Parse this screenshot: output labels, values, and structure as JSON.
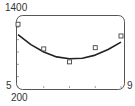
{
  "chart_data": {
    "type": "scatter",
    "title": "",
    "xlabel": "",
    "ylabel": "",
    "xlim": [
      5,
      9
    ],
    "ylim": [
      200,
      1400
    ],
    "x_tick_labels": {
      "min": "5",
      "max": "9"
    },
    "y_tick_labels": {
      "max": "1400",
      "min": "200"
    },
    "x_ticks": [
      5,
      6,
      7,
      8,
      9
    ],
    "y_ticks": [
      400,
      600,
      800,
      1000,
      1200
    ],
    "grid": false,
    "series": [
      {
        "name": "data",
        "type": "scatter",
        "marker": "square",
        "x": [
          5,
          6,
          7,
          8,
          9
        ],
        "y": [
          1250,
          850,
          640,
          870,
          1060
        ]
      },
      {
        "name": "quadratic fit",
        "type": "line",
        "x": [
          5,
          5.5,
          6,
          6.5,
          7,
          7.5,
          8,
          8.5,
          9
        ],
        "y": [
          1080,
          920,
          800,
          720,
          690,
          700,
          750,
          840,
          960
        ]
      }
    ]
  },
  "colors": {
    "frame": "#555555",
    "curve": "#222222",
    "marker": "#444444",
    "text": "#333333"
  }
}
